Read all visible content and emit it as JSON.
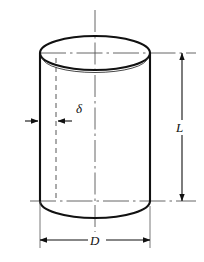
{
  "figure": {
    "kind": "engineering-drawing",
    "background_color": "#ffffff",
    "line_color": "#111111",
    "thin_line_color": "#555555",
    "dimensions": {
      "diameter": {
        "symbol": "D",
        "name": "diameter-dimension",
        "orientation": "horizontal",
        "position": "below"
      },
      "length": {
        "symbol": "L",
        "name": "length-dimension",
        "orientation": "vertical",
        "position": "right"
      },
      "wall_thickness": {
        "symbol": "δ",
        "name": "wall-thickness-dimension",
        "orientation": "horizontal",
        "position": "left-interior"
      }
    },
    "geometry": {
      "cylinder_left_x": 40,
      "cylinder_right_x": 150,
      "top_center_y": 53,
      "bottom_center_y": 201,
      "ellipse_rx": 55,
      "ellipse_ry": 17,
      "inner_wall_x": 56,
      "dim_line_d_y": 240,
      "dim_line_l_x": 182,
      "centerline_x": 95
    }
  }
}
